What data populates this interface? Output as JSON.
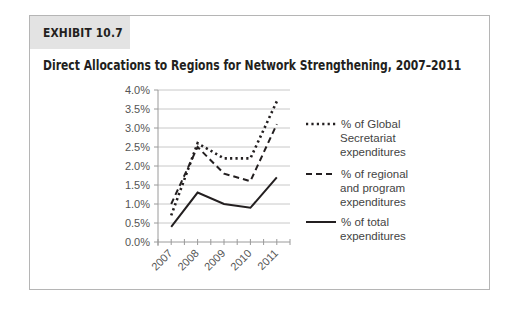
{
  "exhibit": {
    "label": "EXHIBIT 10.7"
  },
  "title": "Direct Allocations to Regions for Network Strengthening, 2007–2011",
  "y_ticks": [
    "0.0%",
    "0.5%",
    "1.0%",
    "1.5%",
    "2.0%",
    "2.5%",
    "3.0%",
    "3.5%",
    "4.0%"
  ],
  "x_ticks": [
    "2007",
    "2008",
    "2009",
    "2010",
    "2011"
  ],
  "legend": [
    {
      "style": "dotted",
      "lines": [
        "% of Global",
        "Secretariat",
        "expenditures"
      ]
    },
    {
      "style": "dashed",
      "lines": [
        "% of regional",
        "and program",
        "expenditures"
      ]
    },
    {
      "style": "solid",
      "lines": [
        "% of total",
        "expenditures"
      ]
    }
  ],
  "colors": {
    "line": "#231f20",
    "grid": "#c8c8c8",
    "axis": "#9a9a9a",
    "frame": "#b5b5b5",
    "label_bg": "#e3e3e3"
  },
  "chart_data": {
    "type": "line",
    "title": "Direct Allocations to Regions for Network Strengthening, 2007–2011",
    "categories": [
      "2007",
      "2008",
      "2009",
      "2010",
      "2011"
    ],
    "series": [
      {
        "name": "% of Global Secretariat expenditures",
        "style": "dotted",
        "values": [
          0.7,
          2.6,
          2.2,
          2.2,
          3.7
        ]
      },
      {
        "name": "% of regional and program expenditures",
        "style": "dashed",
        "values": [
          1.0,
          2.5,
          1.8,
          1.6,
          3.1
        ]
      },
      {
        "name": "% of total expenditures",
        "style": "solid",
        "values": [
          0.4,
          1.3,
          1.0,
          0.9,
          1.7
        ]
      }
    ],
    "xlabel": "",
    "ylabel": "",
    "ylim": [
      0,
      4.0
    ],
    "ytick_step": 0.5,
    "grid": true,
    "legend_position": "right"
  }
}
